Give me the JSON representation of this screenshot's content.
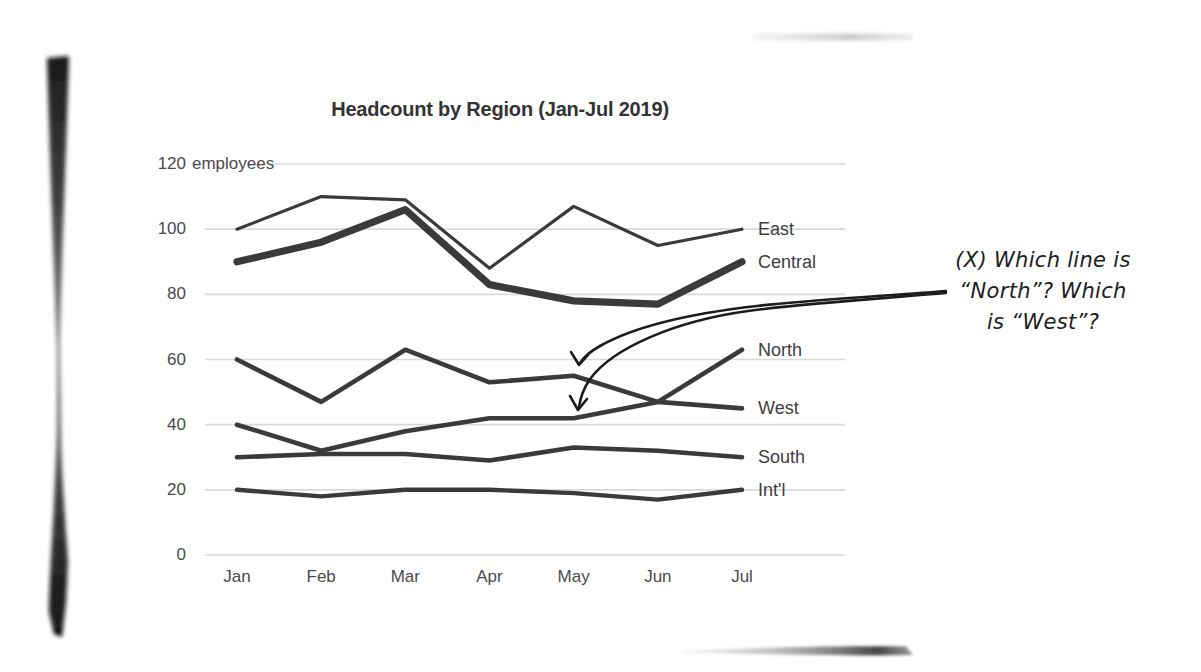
{
  "page": {
    "background": "#ffffff",
    "kind": "scanned book page with hand-drawn annotation"
  },
  "chart_data": {
    "type": "line",
    "title": "Headcount by Region (Jan-Jul 2019)",
    "unit_label": "employees",
    "x": [
      "Jan",
      "Feb",
      "Mar",
      "Apr",
      "May",
      "Jun",
      "Jul"
    ],
    "y_ticks": [
      0,
      20,
      40,
      60,
      80,
      100,
      120
    ],
    "ylim": [
      0,
      120
    ],
    "grid": true,
    "legend_position": "labels at right end of each line",
    "series": [
      {
        "name": "East",
        "values": [
          100,
          110,
          109,
          88,
          107,
          95,
          100
        ],
        "thickness": 3.2
      },
      {
        "name": "Central",
        "values": [
          90,
          96,
          106,
          83,
          78,
          77,
          90
        ],
        "thickness": 7.2
      },
      {
        "name": "North",
        "values": [
          40,
          32,
          38,
          42,
          42,
          47,
          63
        ],
        "thickness": 4.6
      },
      {
        "name": "West",
        "values": [
          60,
          47,
          63,
          53,
          55,
          47,
          45
        ],
        "thickness": 4.6
      },
      {
        "name": "South",
        "values": [
          30,
          31,
          31,
          29,
          33,
          32,
          30
        ],
        "thickness": 4.6
      },
      {
        "name": "Int'l",
        "values": [
          20,
          18,
          20,
          20,
          19,
          17,
          20
        ],
        "thickness": 4.4
      }
    ]
  },
  "annotation": {
    "line1": "(X) Which line is",
    "line2": "“North”? Which",
    "line3": "is “West”?",
    "arrow_targets": [
      "upper line at May",
      "lower line at May"
    ]
  },
  "colors": {
    "ink": "#3a3a3a",
    "grid": "#d9d9d9",
    "axis_text": "#4a4a4a",
    "title_text": "#333333",
    "annotation_ink": "#1c1c1c"
  }
}
